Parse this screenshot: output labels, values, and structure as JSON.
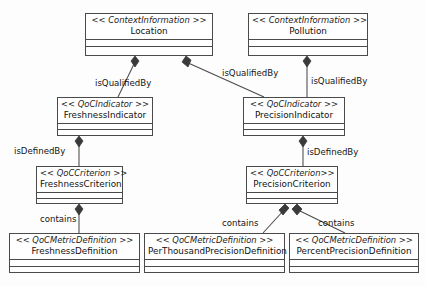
{
  "diagram": {
    "type": "uml-class-diagram",
    "width": 425,
    "height": 286,
    "background_color": "#fdfdfd",
    "line_color": "#4a4a4a"
  },
  "classes": [
    {
      "id": "location",
      "stereotype": "<< ContextInformation >>",
      "name": "Location",
      "x": 85,
      "y": 13,
      "w": 128,
      "h": 43
    },
    {
      "id": "pollution",
      "stereotype": "<< ContextInformation >>",
      "name": "Pollution",
      "x": 248,
      "y": 13,
      "w": 120,
      "h": 43
    },
    {
      "id": "freshness_indicator",
      "stereotype": "<< QoCIndicator >>",
      "name": "FreshnessIndicator",
      "x": 57,
      "y": 97,
      "w": 96,
      "h": 39
    },
    {
      "id": "precision_indicator",
      "stereotype": "<< QoCIndicator >>",
      "name": "PrecisionIndicator",
      "x": 243,
      "y": 97,
      "w": 102,
      "h": 39
    },
    {
      "id": "freshness_criterion",
      "stereotype": "<< QoCCriterion >>",
      "name": "FreshnessCriterion",
      "x": 36,
      "y": 166,
      "w": 87,
      "h": 38
    },
    {
      "id": "precision_criterion",
      "stereotype": "<< QoCCriterion>>",
      "name": "PrecisionCriterion",
      "x": 246,
      "y": 166,
      "w": 92,
      "h": 38
    },
    {
      "id": "freshness_definition",
      "stereotype": "<< QoCMetricDefinition >>",
      "name": "FreshnessDefinition",
      "x": 9,
      "y": 233,
      "w": 131,
      "h": 40
    },
    {
      "id": "perthousand_precision_definition",
      "stereotype": "<< QoCMetricDefinition >>",
      "name": "PerThousandPrecisionDefinition",
      "x": 144,
      "y": 233,
      "w": 141,
      "h": 40
    },
    {
      "id": "percent_precision_definition",
      "stereotype": "<< QoCMetricDefinition >>",
      "name": "PercentPrecisionDefinition",
      "x": 289,
      "y": 233,
      "w": 130,
      "h": 40
    }
  ],
  "relations": [
    {
      "id": "loc_freshness",
      "label": "isQualifiedBy",
      "from": "location",
      "to": "freshness_indicator",
      "kind": "composition",
      "label_x": 95,
      "label_y": 78
    },
    {
      "id": "loc_precision",
      "label": "isQualifiedBy",
      "from": "location",
      "to": "precision_indicator",
      "kind": "composition",
      "label_x": 222,
      "label_y": 68
    },
    {
      "id": "pol_precision",
      "label": "isQualifiedBy",
      "from": "pollution",
      "to": "precision_indicator",
      "kind": "composition",
      "label_x": 311,
      "label_y": 76
    },
    {
      "id": "freshness_ind_crit",
      "label": "isDefinedBy",
      "from": "freshness_indicator",
      "to": "freshness_criterion",
      "kind": "composition",
      "label_x": 14,
      "label_y": 146
    },
    {
      "id": "precision_ind_crit",
      "label": "isDefinedBy",
      "from": "precision_indicator",
      "to": "precision_criterion",
      "kind": "composition",
      "label_x": 307,
      "label_y": 147
    },
    {
      "id": "freshness_crit_def",
      "label": "contains",
      "from": "freshness_criterion",
      "to": "freshness_definition",
      "kind": "composition",
      "label_x": 40,
      "label_y": 214
    },
    {
      "id": "precision_crit_perthousand",
      "label": "contains",
      "from": "precision_criterion",
      "to": "perthousand_precision_definition",
      "kind": "composition",
      "label_x": 222,
      "label_y": 218
    },
    {
      "id": "precision_crit_percent",
      "label": "contains",
      "from": "precision_criterion",
      "to": "percent_precision_definition",
      "kind": "composition",
      "label_x": 318,
      "label_y": 218
    }
  ]
}
